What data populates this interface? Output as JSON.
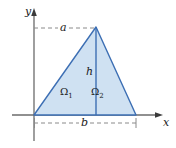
{
  "figure": {
    "name": "triangle-region-diagram",
    "background_color": "#ffffff",
    "axes": {
      "x_label": "x",
      "y_label": "y",
      "axis_color": "#6b6b6b",
      "origin": {
        "x": 34,
        "y": 115
      }
    },
    "shape": {
      "type": "triangle",
      "fill_color": "#cfe1f2",
      "stroke_color": "#3d6fb4",
      "vertices": [
        {
          "x": 34,
          "y": 115
        },
        {
          "x": 136,
          "y": 115
        },
        {
          "x": 96,
          "y": 27
        }
      ],
      "divider": {
        "label": "h",
        "from": {
          "x": 96,
          "y": 27
        },
        "to": {
          "x": 96,
          "y": 115
        }
      }
    },
    "dimensions": [
      {
        "name": "a",
        "label": "a",
        "orientation": "horizontal",
        "from_x": 34,
        "to_x": 96,
        "y": 28
      },
      {
        "name": "b",
        "label": "b",
        "orientation": "horizontal",
        "from_x": 34,
        "to_x": 136,
        "y": 123
      },
      {
        "name": "h",
        "label": "h",
        "orientation": "vertical",
        "x": 96,
        "from_y": 27,
        "to_y": 115
      }
    ],
    "regions": [
      {
        "name": "omega-1",
        "base": "Ω",
        "subscript": "1"
      },
      {
        "name": "omega-2",
        "base": "Ω",
        "subscript": "2"
      }
    ],
    "guide_color": "#8a8a8a"
  }
}
